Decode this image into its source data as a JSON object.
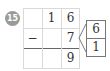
{
  "problem_number": "15",
  "grid": {
    "rows": [
      [
        "",
        "1",
        "6"
      ],
      [
        "−",
        "",
        "7"
      ],
      [
        "",
        "",
        "9"
      ]
    ]
  },
  "decomposition": {
    "target_value": "7",
    "parts": [
      "6",
      "1"
    ]
  }
}
